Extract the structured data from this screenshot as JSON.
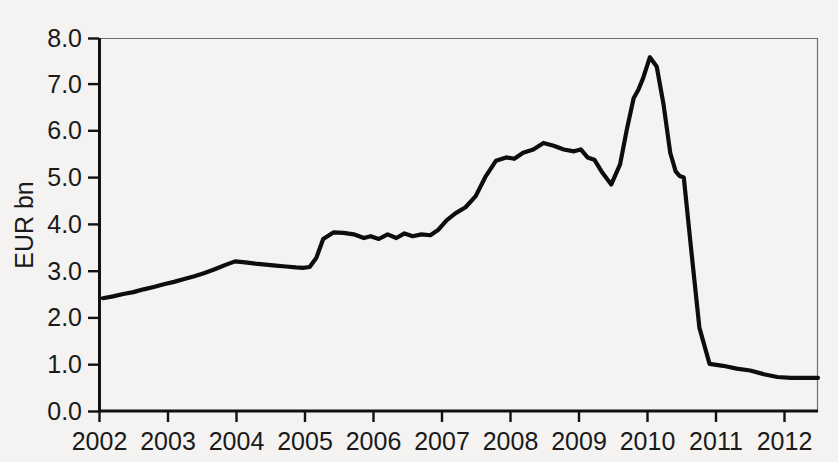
{
  "chart_data": {
    "type": "line",
    "title": "",
    "subtitle": "",
    "xlabel": "",
    "ylabel": "EUR bn",
    "xlim": [
      2002.0,
      2012.6
    ],
    "ylim": [
      0.0,
      8.0
    ],
    "grid": false,
    "legend": null,
    "x_tick_labels": [
      "2002",
      "2003",
      "2004",
      "2005",
      "2006",
      "2007",
      "2008",
      "2009",
      "2010",
      "2011",
      "2012"
    ],
    "x_ticks": [
      2002,
      2003,
      2004,
      2005,
      2006,
      2007,
      2008,
      2009,
      2010,
      2011,
      2012
    ],
    "y_tick_labels": [
      "0.0",
      "1.0",
      "2.0",
      "3.0",
      "4.0",
      "5.0",
      "6.0",
      "7.0",
      "8.0"
    ],
    "y_ticks": [
      0.0,
      1.0,
      2.0,
      3.0,
      4.0,
      5.0,
      6.0,
      7.0,
      8.0
    ],
    "series": [
      {
        "name": "EUR bn",
        "color": "#0d0d0d",
        "x": [
          2002.05,
          2002.2,
          2002.35,
          2002.5,
          2002.65,
          2002.8,
          2002.95,
          2003.1,
          2003.25,
          2003.4,
          2003.55,
          2003.7,
          2003.85,
          2004.0,
          2004.15,
          2004.3,
          2004.45,
          2004.6,
          2004.75,
          2004.9,
          2005.0,
          2005.1,
          2005.2,
          2005.3,
          2005.45,
          2005.6,
          2005.75,
          2005.9,
          2006.0,
          2006.12,
          2006.25,
          2006.38,
          2006.5,
          2006.62,
          2006.75,
          2006.88,
          2007.0,
          2007.12,
          2007.25,
          2007.4,
          2007.55,
          2007.7,
          2007.85,
          2008.0,
          2008.12,
          2008.25,
          2008.4,
          2008.55,
          2008.7,
          2008.85,
          2009.0,
          2009.1,
          2009.2,
          2009.3,
          2009.42,
          2009.55,
          2009.68,
          2009.78,
          2009.88,
          2009.95,
          2010.02,
          2010.12,
          2010.22,
          2010.32,
          2010.42,
          2010.5,
          2010.56,
          2010.62,
          2010.72,
          2010.85,
          2011.0,
          2011.2,
          2011.4,
          2011.6,
          2011.8,
          2012.0,
          2012.2,
          2012.4,
          2012.6
        ],
        "y": [
          2.43,
          2.47,
          2.52,
          2.56,
          2.62,
          2.67,
          2.73,
          2.78,
          2.84,
          2.9,
          2.97,
          3.05,
          3.14,
          3.22,
          3.2,
          3.17,
          3.15,
          3.13,
          3.11,
          3.09,
          3.08,
          3.1,
          3.3,
          3.7,
          3.84,
          3.83,
          3.8,
          3.72,
          3.76,
          3.7,
          3.8,
          3.72,
          3.82,
          3.76,
          3.8,
          3.78,
          3.9,
          4.1,
          4.25,
          4.38,
          4.62,
          5.05,
          5.38,
          5.45,
          5.42,
          5.55,
          5.62,
          5.76,
          5.7,
          5.62,
          5.58,
          5.62,
          5.45,
          5.4,
          5.12,
          4.87,
          5.3,
          6.05,
          6.72,
          6.9,
          7.15,
          7.6,
          7.4,
          6.6,
          5.55,
          5.15,
          5.05,
          5.02,
          3.6,
          1.8,
          1.02,
          0.98,
          0.92,
          0.88,
          0.8,
          0.74,
          0.72,
          0.72,
          0.72
        ]
      }
    ],
    "annotations": [],
    "notable_points": {
      "start_2002": 2.43,
      "local_peak_2004": 3.22,
      "trough_2005": 3.08,
      "plateau_2005_2007": 3.8,
      "peak_2008": 5.76,
      "dip_2009": 4.87,
      "spike_peak_late_2009": 7.6,
      "shelf_2010": 5.05,
      "post_collapse_2010": 1.02,
      "end_2012": 0.72
    }
  },
  "figure": {
    "background_color": "#f4f3f1",
    "line_color": "#0d0d0d",
    "axis_color": "#111111",
    "frame_color": "#6e6e6e"
  }
}
